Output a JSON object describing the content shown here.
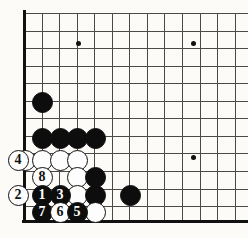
{
  "diagram": {
    "kind": "go-board-diagram",
    "title": "",
    "board": {
      "cell": 17.55,
      "origin_x": 24,
      "origin_y": 13,
      "cols": 13,
      "rows": 12,
      "bottom_edge_y": 220,
      "left_edge_x": 24,
      "line_color": "#4a4a48",
      "edge_color": "#111111",
      "background": "#fcfbf8"
    },
    "star_points": [
      {
        "x": 78,
        "y": 43
      },
      {
        "x": 193,
        "y": 43
      },
      {
        "x": 193,
        "y": 157
      }
    ],
    "stones": [
      {
        "name": "black-stone-upper-left",
        "color": "black",
        "label": "",
        "x": 42,
        "y": 102
      },
      {
        "name": "black-stone-wall-a",
        "color": "black",
        "label": "",
        "x": 42,
        "y": 138
      },
      {
        "name": "black-stone-wall-b",
        "color": "black",
        "label": "",
        "x": 60,
        "y": 138
      },
      {
        "name": "black-stone-wall-c",
        "color": "black",
        "label": "",
        "x": 77,
        "y": 138
      },
      {
        "name": "black-stone-wall-d",
        "color": "black",
        "label": "",
        "x": 95,
        "y": 138
      },
      {
        "name": "white-stone-row2-a",
        "color": "white",
        "label": "",
        "x": 25,
        "y": 160
      },
      {
        "name": "white-stone-row2-b",
        "color": "white",
        "label": "",
        "x": 42,
        "y": 160
      },
      {
        "name": "white-stone-row2-c",
        "color": "white",
        "label": "",
        "x": 60,
        "y": 160
      },
      {
        "name": "white-stone-row2-d",
        "color": "white",
        "label": "",
        "x": 77,
        "y": 160
      },
      {
        "name": "white-stone-row3-c",
        "color": "white",
        "label": "",
        "x": 77,
        "y": 177
      },
      {
        "name": "black-stone-row3-d",
        "color": "black",
        "label": "",
        "x": 95,
        "y": 177
      },
      {
        "name": "white-stone-row4-c",
        "color": "white",
        "label": "",
        "x": 77,
        "y": 195
      },
      {
        "name": "black-stone-row4-d",
        "color": "black",
        "label": "",
        "x": 95,
        "y": 195
      },
      {
        "name": "black-stone-row4-f",
        "color": "black",
        "label": "",
        "x": 130,
        "y": 195
      },
      {
        "name": "white-stone-row5-d",
        "color": "white",
        "label": "",
        "x": 95,
        "y": 212
      },
      {
        "name": "move-4-white",
        "color": "white",
        "label": "4",
        "x": 18,
        "y": 160
      },
      {
        "name": "move-2-white",
        "color": "white",
        "label": "2",
        "x": 18,
        "y": 195
      },
      {
        "name": "move-8-white",
        "color": "white",
        "label": "8",
        "x": 42,
        "y": 177
      },
      {
        "name": "move-1-black",
        "color": "black",
        "label": "1",
        "x": 42,
        "y": 195
      },
      {
        "name": "move-3-black",
        "color": "black",
        "label": "3",
        "x": 60,
        "y": 195
      },
      {
        "name": "move-7-black",
        "color": "black",
        "label": "7",
        "x": 42,
        "y": 212
      },
      {
        "name": "move-6-white",
        "color": "white",
        "label": "6",
        "x": 60,
        "y": 212
      },
      {
        "name": "move-5-black",
        "color": "black",
        "label": "5",
        "x": 77,
        "y": 212
      }
    ],
    "move_numbers": [
      "1",
      "2",
      "3",
      "4",
      "5",
      "6",
      "7",
      "8"
    ]
  }
}
